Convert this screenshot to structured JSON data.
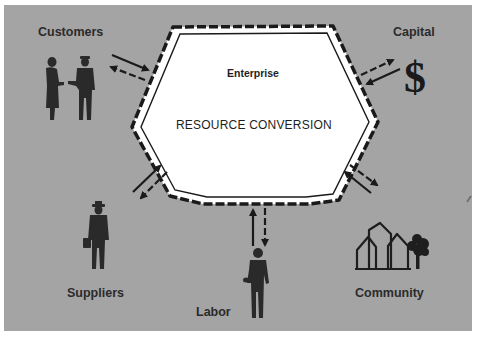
{
  "diagram": {
    "center": {
      "title": "Enterprise",
      "subtitle": "RESOURCE CONVERSION"
    },
    "stakeholders": [
      {
        "id": "customers",
        "label": "Customers",
        "icon": "handshake-people-icon"
      },
      {
        "id": "capital",
        "label": "Capital",
        "icon": "dollar-sign-icon",
        "glyph": "$"
      },
      {
        "id": "suppliers",
        "label": "Suppliers",
        "icon": "businessman-briefcase-icon"
      },
      {
        "id": "labor",
        "label": "Labor",
        "icon": "worker-icon"
      },
      {
        "id": "community",
        "label": "Community",
        "icon": "houses-tree-icon"
      }
    ],
    "flows": "bidirectional arrows between each stakeholder and the enterprise",
    "colors": {
      "background": "#a4a4a4",
      "hexagon_fill": "#ffffff",
      "ink": "#1a1a1a",
      "text": "#2b2b2b"
    }
  }
}
